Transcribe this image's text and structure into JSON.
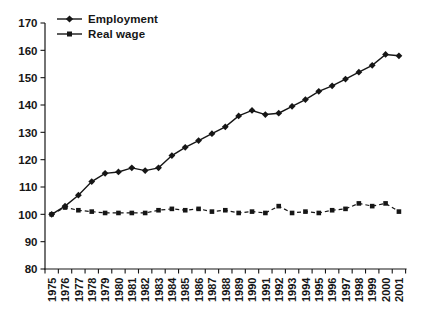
{
  "chart_data": {
    "type": "line",
    "title": "",
    "xlabel": "",
    "ylabel": "",
    "x": [
      "1975",
      "1976",
      "1977",
      "1978",
      "1979",
      "1980",
      "1981",
      "1982",
      "1983",
      "1984",
      "1985",
      "1986",
      "1987",
      "1988",
      "1989",
      "1990",
      "1991",
      "1992",
      "1993",
      "1994",
      "1995",
      "1996",
      "1997",
      "1998",
      "1999",
      "2000",
      "2001"
    ],
    "series": [
      {
        "name": "Employment",
        "marker": "diamond",
        "line_style": "solid",
        "values": [
          100,
          103,
          107,
          112,
          115,
          115.5,
          117,
          116,
          117,
          121.5,
          124.5,
          127,
          129.5,
          132,
          136,
          138,
          136.5,
          137,
          139.5,
          142,
          145,
          147,
          149.5,
          152,
          154.5,
          158.5,
          158
        ]
      },
      {
        "name": "Real wage",
        "marker": "square",
        "line_style": "dashed",
        "values": [
          100,
          102.5,
          101.5,
          101,
          100.5,
          100.5,
          100.5,
          100.5,
          101.5,
          102,
          101.5,
          102,
          101,
          101.5,
          100.5,
          101,
          100.5,
          103,
          100.5,
          101,
          100.5,
          101.5,
          102,
          104,
          103,
          104,
          101
        ]
      }
    ],
    "ylim": [
      80,
      170
    ],
    "yticks": [
      80,
      90,
      100,
      110,
      120,
      130,
      140,
      150,
      160,
      170
    ],
    "legend_position": "top-left",
    "grid": false,
    "colors": {
      "line": "#161616",
      "background": "#ffffff"
    }
  }
}
